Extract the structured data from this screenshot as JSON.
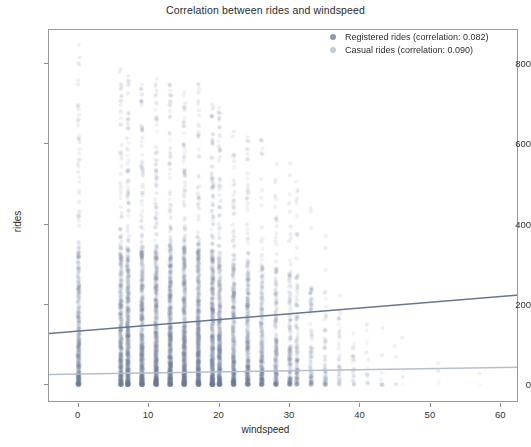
{
  "chart_data": {
    "type": "scatter",
    "title": "Correlation between rides and windspeed",
    "xlabel": "windspeed",
    "ylabel": "rides",
    "xlim": [
      -4.2,
      62.5
    ],
    "ylim": [
      -45,
      885
    ],
    "xticks": [
      0,
      10,
      20,
      30,
      40,
      50,
      60
    ],
    "xticklabels": [
      "0",
      "10",
      "20",
      "30",
      "40",
      "50",
      "60"
    ],
    "yticks": [
      0,
      200,
      400,
      600,
      800
    ],
    "yticklabels": [
      "0",
      "200",
      "400",
      "600",
      "800"
    ],
    "grid": false,
    "legend_position": "upper right",
    "marker": "circle",
    "marker_alpha": 0.08,
    "series": [
      {
        "name": "Registered rides (correlation: 0.082)",
        "short_name": "Registered rides",
        "correlation": 0.082,
        "color": "#6b7a95",
        "line_color": "#5f6f8a",
        "trend": {
          "x": [
            -4.2,
            62.5
          ],
          "y": [
            128,
            224
          ]
        },
        "bands": [
          {
            "x": 0.0,
            "n": 310,
            "low": 0,
            "high": 860,
            "dense_to": 330
          },
          {
            "x": 6.0,
            "n": 330,
            "low": 0,
            "high": 800,
            "dense_to": 330
          },
          {
            "x": 7.0,
            "n": 380,
            "low": 0,
            "high": 780,
            "dense_to": 340
          },
          {
            "x": 8.998,
            "n": 410,
            "low": 0,
            "high": 760,
            "dense_to": 345
          },
          {
            "x": 11.0,
            "n": 430,
            "low": 0,
            "high": 790,
            "dense_to": 350
          },
          {
            "x": 12.998,
            "n": 440,
            "low": 0,
            "high": 760,
            "dense_to": 350
          },
          {
            "x": 15.0,
            "n": 430,
            "low": 0,
            "high": 740,
            "dense_to": 345
          },
          {
            "x": 16.998,
            "n": 410,
            "low": 0,
            "high": 760,
            "dense_to": 340
          },
          {
            "x": 19.0,
            "n": 380,
            "low": 0,
            "high": 720,
            "dense_to": 335
          },
          {
            "x": 19.999,
            "n": 340,
            "low": 0,
            "high": 700,
            "dense_to": 330
          },
          {
            "x": 22.0,
            "n": 300,
            "low": 0,
            "high": 680,
            "dense_to": 320
          },
          {
            "x": 23.999,
            "n": 250,
            "low": 0,
            "high": 640,
            "dense_to": 310
          },
          {
            "x": 26.0,
            "n": 200,
            "low": 0,
            "high": 620,
            "dense_to": 300
          },
          {
            "x": 27.999,
            "n": 160,
            "low": 0,
            "high": 580,
            "dense_to": 290
          },
          {
            "x": 30.0,
            "n": 120,
            "low": 0,
            "high": 560,
            "dense_to": 280
          },
          {
            "x": 31.0,
            "n": 95,
            "low": 0,
            "high": 520,
            "dense_to": 270
          },
          {
            "x": 32.998,
            "n": 70,
            "low": 0,
            "high": 470,
            "dense_to": 250
          },
          {
            "x": 35.0,
            "n": 45,
            "low": 0,
            "high": 420,
            "dense_to": 230
          },
          {
            "x": 36.997,
            "n": 28,
            "low": 0,
            "high": 360,
            "dense_to": 200
          },
          {
            "x": 39.0,
            "n": 16,
            "low": 0,
            "high": 300,
            "dense_to": 170
          },
          {
            "x": 40.997,
            "n": 9,
            "low": 0,
            "high": 240,
            "dense_to": 140
          },
          {
            "x": 43.0,
            "n": 6,
            "low": 0,
            "high": 190,
            "dense_to": 120
          },
          {
            "x": 44.999,
            "n": 3,
            "low": 0,
            "high": 150,
            "dense_to": 100
          },
          {
            "x": 46.0,
            "n": 2,
            "low": 0,
            "high": 120,
            "dense_to": 90
          },
          {
            "x": 51.0,
            "n": 2,
            "low": 0,
            "high": 90,
            "dense_to": 70
          },
          {
            "x": 56.997,
            "n": 1,
            "low": 0,
            "high": 60,
            "dense_to": 50
          }
        ]
      },
      {
        "name": "Casual rides (correlation: 0.090)",
        "short_name": "Casual rides",
        "correlation": 0.09,
        "color": "#b9c3d2",
        "line_color": "#b2bccb",
        "trend": {
          "x": [
            -4.2,
            62.5
          ],
          "y": [
            26,
            44
          ]
        },
        "bands": [
          {
            "x": 0.0,
            "n": 240,
            "low": 0,
            "high": 300,
            "dense_to": 120
          },
          {
            "x": 6.0,
            "n": 260,
            "low": 0,
            "high": 320,
            "dense_to": 125
          },
          {
            "x": 7.0,
            "n": 300,
            "low": 0,
            "high": 330,
            "dense_to": 130
          },
          {
            "x": 8.998,
            "n": 320,
            "low": 0,
            "high": 340,
            "dense_to": 130
          },
          {
            "x": 11.0,
            "n": 340,
            "low": 0,
            "high": 350,
            "dense_to": 135
          },
          {
            "x": 12.998,
            "n": 350,
            "low": 0,
            "high": 340,
            "dense_to": 135
          },
          {
            "x": 15.0,
            "n": 340,
            "low": 0,
            "high": 330,
            "dense_to": 130
          },
          {
            "x": 16.998,
            "n": 320,
            "low": 0,
            "high": 330,
            "dense_to": 130
          },
          {
            "x": 19.0,
            "n": 300,
            "low": 0,
            "high": 320,
            "dense_to": 125
          },
          {
            "x": 19.999,
            "n": 270,
            "low": 0,
            "high": 310,
            "dense_to": 125
          },
          {
            "x": 22.0,
            "n": 235,
            "low": 0,
            "high": 300,
            "dense_to": 120
          },
          {
            "x": 23.999,
            "n": 195,
            "low": 0,
            "high": 280,
            "dense_to": 115
          },
          {
            "x": 26.0,
            "n": 155,
            "low": 0,
            "high": 270,
            "dense_to": 110
          },
          {
            "x": 27.999,
            "n": 125,
            "low": 0,
            "high": 250,
            "dense_to": 105
          },
          {
            "x": 30.0,
            "n": 95,
            "low": 0,
            "high": 240,
            "dense_to": 100
          },
          {
            "x": 31.0,
            "n": 75,
            "low": 0,
            "high": 220,
            "dense_to": 95
          },
          {
            "x": 32.998,
            "n": 55,
            "low": 0,
            "high": 200,
            "dense_to": 90
          },
          {
            "x": 35.0,
            "n": 36,
            "low": 0,
            "high": 180,
            "dense_to": 80
          },
          {
            "x": 36.997,
            "n": 22,
            "low": 0,
            "high": 150,
            "dense_to": 70
          },
          {
            "x": 39.0,
            "n": 13,
            "low": 0,
            "high": 130,
            "dense_to": 60
          },
          {
            "x": 40.997,
            "n": 7,
            "low": 0,
            "high": 110,
            "dense_to": 55
          },
          {
            "x": 43.0,
            "n": 5,
            "low": 0,
            "high": 90,
            "dense_to": 50
          },
          {
            "x": 44.999,
            "n": 3,
            "low": 0,
            "high": 80,
            "dense_to": 45
          },
          {
            "x": 46.0,
            "n": 2,
            "low": 0,
            "high": 70,
            "dense_to": 40
          },
          {
            "x": 51.0,
            "n": 2,
            "low": 0,
            "high": 55,
            "dense_to": 35
          },
          {
            "x": 56.997,
            "n": 1,
            "low": 0,
            "high": 40,
            "dense_to": 30
          }
        ]
      }
    ]
  },
  "legend": {
    "items": [
      {
        "label": "Registered rides (correlation: 0.082)",
        "color": "#8c99ae"
      },
      {
        "label": "Casual rides (correlation: 0.090)",
        "color": "#c3cbd8"
      }
    ]
  }
}
